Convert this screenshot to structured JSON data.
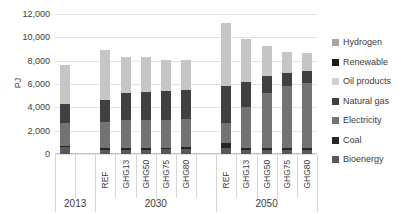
{
  "chart_data": {
    "type": "bar",
    "stacked": true,
    "title": "",
    "xlabel": "",
    "ylabel": "PJ",
    "ylim": [
      0,
      12000
    ],
    "yticks": [
      0,
      2000,
      4000,
      6000,
      8000,
      10000,
      12000
    ],
    "ytick_labels": [
      "0",
      "2,000",
      "4,000",
      "6,000",
      "8,000",
      "10,000",
      "12,000"
    ],
    "grid": true,
    "legend_position": "right",
    "groups": [
      {
        "label": "2013",
        "categories": [
          "",
          "",
          ""
        ]
      },
      {
        "label": "2030",
        "categories": [
          "REF",
          "GHG13",
          "GHG50",
          "GHG75",
          "GHG80"
        ]
      },
      {
        "label": "2050",
        "categories": [
          "REF",
          "GHG13",
          "GHG50",
          "GHG75",
          "GHG80"
        ]
      }
    ],
    "categories": [
      "",
      "",
      "REF",
      "GHG13",
      "GHG50",
      "GHG75",
      "GHG80",
      "",
      "REF",
      "GHG13",
      "GHG50",
      "GHG75",
      "GHG80"
    ],
    "series": [
      {
        "name": "Bioenergy",
        "color": "#595959",
        "values": [
          null,
          null,
          420,
          330,
          340,
          350,
          360,
          null,
          480,
          300,
          300,
          300,
          300
        ]
      },
      {
        "name": "Coal",
        "color": "#262626",
        "values": [
          null,
          null,
          200,
          140,
          140,
          140,
          140,
          null,
          440,
          140,
          140,
          140,
          140
        ]
      },
      {
        "name": "Electricity",
        "color": "#737373",
        "values": [
          null,
          null,
          2000,
          2640,
          2700,
          2740,
          2800,
          null,
          1640,
          3500,
          4680,
          5180,
          5400
        ]
      },
      {
        "name": "Natural gas",
        "color": "#404040",
        "values": [
          null,
          null,
          1600,
          2100,
          2060,
          2060,
          2100,
          null,
          3100,
          2050,
          1640,
          1240,
          1160
        ]
      },
      {
        "name": "Oil products",
        "color": "#bfbfbf",
        "values": [
          null,
          null,
          3400,
          3000,
          3000,
          2780,
          2580,
          null,
          5500,
          3400,
          2200,
          1500,
          900
        ]
      },
      {
        "name": "Renewable",
        "color": "#1a1a1a",
        "values": [
          null,
          null,
          100,
          100,
          100,
          100,
          100,
          null,
          80,
          100,
          100,
          100,
          100
        ]
      },
      {
        "name": "Hydrogen",
        "color": "#a6a6a6",
        "values": [
          null,
          null,
          0,
          0,
          0,
          0,
          0,
          null,
          0,
          150,
          200,
          300,
          400
        ]
      }
    ],
    "series_2013": {
      "label": "2013",
      "Bioenergy": 560,
      "Coal": 120,
      "Electricity": 2000,
      "Natural gas": 1580,
      "Oil products": 3340,
      "Renewable": 0,
      "Hydrogen": 0,
      "total": 7600
    },
    "legend": [
      {
        "label": "Hydrogen",
        "color": "#a6a6a6"
      },
      {
        "label": "Renewable",
        "color": "#1a1a1a"
      },
      {
        "label": "Oil products",
        "color": "#d0d0d0"
      },
      {
        "label": "Natural gas",
        "color": "#404040"
      },
      {
        "label": "Electricity",
        "color": "#737373"
      },
      {
        "label": "Coal",
        "color": "#262626"
      },
      {
        "label": "Bioenergy",
        "color": "#595959"
      }
    ],
    "bars": [
      {
        "group": "2013",
        "category": "",
        "total": 7600,
        "segments": [
          {
            "name": "Bioenergy",
            "value": 560,
            "color": "#595959"
          },
          {
            "name": "Coal",
            "value": 120,
            "color": "#262626"
          },
          {
            "name": "Electricity",
            "value": 2000,
            "color": "#737373"
          },
          {
            "name": "Natural gas",
            "value": 1580,
            "color": "#404040"
          },
          {
            "name": "Oil products",
            "value": 3340,
            "color": "#c6c6c6"
          }
        ]
      },
      {
        "group": "2030",
        "category": "REF",
        "total": 8950,
        "segments": [
          {
            "name": "Bioenergy",
            "value": 330,
            "color": "#595959"
          },
          {
            "name": "Coal",
            "value": 190,
            "color": "#262626"
          },
          {
            "name": "Electricity",
            "value": 2230,
            "color": "#737373"
          },
          {
            "name": "Natural gas",
            "value": 1900,
            "color": "#404040"
          },
          {
            "name": "Oil products",
            "value": 4300,
            "color": "#c6c6c6"
          }
        ]
      },
      {
        "group": "2030",
        "category": "GHG13",
        "total": 8300,
        "segments": [
          {
            "name": "Bioenergy",
            "value": 380,
            "color": "#595959"
          },
          {
            "name": "Coal",
            "value": 150,
            "color": "#262626"
          },
          {
            "name": "Electricity",
            "value": 2420,
            "color": "#737373"
          },
          {
            "name": "Natural gas",
            "value": 2300,
            "color": "#404040"
          },
          {
            "name": "Oil products",
            "value": 3050,
            "color": "#c6c6c6"
          }
        ]
      },
      {
        "group": "2030",
        "category": "GHG50",
        "total": 8330,
        "segments": [
          {
            "name": "Bioenergy",
            "value": 380,
            "color": "#595959"
          },
          {
            "name": "Coal",
            "value": 150,
            "color": "#262626"
          },
          {
            "name": "Electricity",
            "value": 2400,
            "color": "#737373"
          },
          {
            "name": "Natural gas",
            "value": 2350,
            "color": "#404040"
          },
          {
            "name": "Oil products",
            "value": 3050,
            "color": "#c6c6c6"
          }
        ]
      },
      {
        "group": "2030",
        "category": "GHG75",
        "total": 8100,
        "segments": [
          {
            "name": "Bioenergy",
            "value": 400,
            "color": "#595959"
          },
          {
            "name": "Coal",
            "value": 150,
            "color": "#262626"
          },
          {
            "name": "Electricity",
            "value": 2400,
            "color": "#737373"
          },
          {
            "name": "Natural gas",
            "value": 2450,
            "color": "#404040"
          },
          {
            "name": "Oil products",
            "value": 2700,
            "color": "#c6c6c6"
          }
        ]
      },
      {
        "group": "2030",
        "category": "GHG80",
        "total": 8050,
        "segments": [
          {
            "name": "Bioenergy",
            "value": 430,
            "color": "#595959"
          },
          {
            "name": "Coal",
            "value": 150,
            "color": "#262626"
          },
          {
            "name": "Electricity",
            "value": 2400,
            "color": "#737373"
          },
          {
            "name": "Natural gas",
            "value": 2520,
            "color": "#404040"
          },
          {
            "name": "Oil products",
            "value": 2550,
            "color": "#c6c6c6"
          }
        ]
      },
      {
        "group": "2050",
        "category": "REF",
        "total": 11200,
        "segments": [
          {
            "name": "Bioenergy",
            "value": 480,
            "color": "#595959"
          },
          {
            "name": "Coal",
            "value": 430,
            "color": "#262626"
          },
          {
            "name": "Electricity",
            "value": 1790,
            "color": "#737373"
          },
          {
            "name": "Natural gas",
            "value": 3100,
            "color": "#404040"
          },
          {
            "name": "Oil products",
            "value": 5400,
            "color": "#c6c6c6"
          }
        ]
      },
      {
        "group": "2050",
        "category": "GHG13",
        "total": 9900,
        "segments": [
          {
            "name": "Bioenergy",
            "value": 330,
            "color": "#595959"
          },
          {
            "name": "Coal",
            "value": 170,
            "color": "#262626"
          },
          {
            "name": "Electricity",
            "value": 3500,
            "color": "#737373"
          },
          {
            "name": "Natural gas",
            "value": 2200,
            "color": "#404040"
          },
          {
            "name": "Oil products",
            "value": 3700,
            "color": "#c6c6c6"
          }
        ]
      },
      {
        "group": "2050",
        "category": "GHG50",
        "total": 9250,
        "segments": [
          {
            "name": "Bioenergy",
            "value": 330,
            "color": "#595959"
          },
          {
            "name": "Coal",
            "value": 170,
            "color": "#262626"
          },
          {
            "name": "Electricity",
            "value": 4750,
            "color": "#737373"
          },
          {
            "name": "Natural gas",
            "value": 1400,
            "color": "#404040"
          },
          {
            "name": "Oil products",
            "value": 2600,
            "color": "#c6c6c6"
          }
        ]
      },
      {
        "group": "2050",
        "category": "GHG75",
        "total": 8750,
        "segments": [
          {
            "name": "Bioenergy",
            "value": 330,
            "color": "#595959"
          },
          {
            "name": "Coal",
            "value": 170,
            "color": "#262626"
          },
          {
            "name": "Electricity",
            "value": 5350,
            "color": "#737373"
          },
          {
            "name": "Natural gas",
            "value": 1100,
            "color": "#404040"
          },
          {
            "name": "Oil products",
            "value": 1800,
            "color": "#c6c6c6"
          }
        ]
      },
      {
        "group": "2050",
        "category": "GHG80",
        "total": 8650,
        "segments": [
          {
            "name": "Bioenergy",
            "value": 330,
            "color": "#595959"
          },
          {
            "name": "Coal",
            "value": 170,
            "color": "#262626"
          },
          {
            "name": "Electricity",
            "value": 5600,
            "color": "#737373"
          },
          {
            "name": "Natural gas",
            "value": 1000,
            "color": "#404040"
          },
          {
            "name": "Oil products",
            "value": 1550,
            "color": "#c6c6c6"
          }
        ]
      }
    ]
  }
}
